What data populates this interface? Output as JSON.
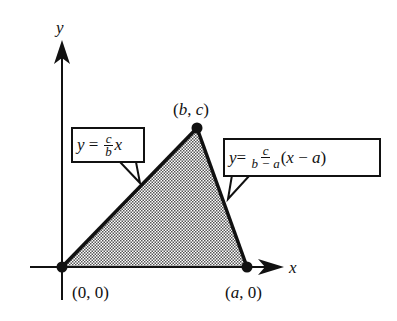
{
  "diagram": {
    "axes": {
      "x_label": "x",
      "y_label": "y"
    },
    "points": [
      {
        "id": "origin",
        "label": "(0, 0)"
      },
      {
        "id": "apex",
        "label_open": "(",
        "label_b": "b",
        "label_sep": ", ",
        "label_c": "c",
        "label_close": ")"
      },
      {
        "id": "a_point",
        "label_open": "(",
        "label_a": "a",
        "label_rest": ", 0)"
      }
    ],
    "callouts": {
      "left_line": {
        "lhs": "y",
        "eq": " = ",
        "num": "c",
        "den": "b",
        "tail": "x"
      },
      "right_line": {
        "lhs": "y",
        "eq": "= ",
        "num": "c",
        "den": "b − a",
        "tail_open": "(",
        "tail_x": "x",
        "tail_minus": " − ",
        "tail_a": "a",
        "tail_close": ")"
      }
    },
    "colors": {
      "stroke": "#111111",
      "fill_pattern": "#555555",
      "background": "#ffffff"
    }
  }
}
